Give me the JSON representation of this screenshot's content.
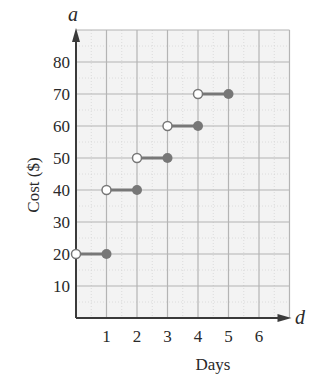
{
  "chart_data": {
    "type": "line",
    "subtype": "step",
    "title": "",
    "xlabel": "Days",
    "ylabel": "Cost ($)",
    "x_variable": "d",
    "y_variable": "a",
    "xlim": [
      0,
      7
    ],
    "ylim": [
      0,
      90
    ],
    "x_ticks": [
      1,
      2,
      3,
      4,
      5,
      6
    ],
    "y_ticks": [
      10,
      20,
      30,
      40,
      50,
      60,
      70,
      80
    ],
    "grid": true,
    "legend": null,
    "segments": [
      {
        "x_start": 0,
        "x_end": 1,
        "value": 20,
        "start_open": true,
        "end_closed": true
      },
      {
        "x_start": 1,
        "x_end": 2,
        "value": 40,
        "start_open": true,
        "end_closed": true
      },
      {
        "x_start": 2,
        "x_end": 3,
        "value": 50,
        "start_open": true,
        "end_closed": true
      },
      {
        "x_start": 3,
        "x_end": 4,
        "value": 60,
        "start_open": true,
        "end_closed": true
      },
      {
        "x_start": 4,
        "x_end": 5,
        "value": 70,
        "start_open": true,
        "end_closed": true
      }
    ]
  },
  "labels": {
    "y_var": "a",
    "x_var": "d",
    "y_title": "Cost ($)",
    "x_title": "Days"
  },
  "colors": {
    "grid_bg": "#f3f3f3",
    "grid_line": "#b4b4b4",
    "axis": "#3a3a3a",
    "series": "#777777"
  }
}
